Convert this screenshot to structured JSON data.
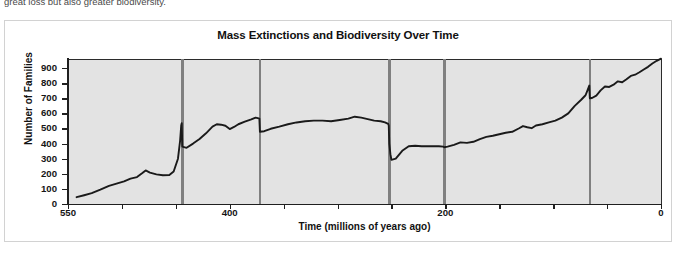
{
  "page_text_fragment": "great loss but also greater biodiversity.",
  "figure": {
    "title": "Mass Extinctions and Biodiversity Over Time"
  },
  "chart_data": {
    "type": "line",
    "title": "Mass Extinctions and Biodiversity Over Time",
    "xlabel": "Time (millions of years ago)",
    "ylabel": "Number of Families",
    "xlim": [
      550,
      0
    ],
    "ylim": [
      0,
      960
    ],
    "x_reversed": true,
    "grid": false,
    "legend": null,
    "y_ticks": [
      0,
      100,
      200,
      300,
      400,
      500,
      600,
      700,
      800,
      900
    ],
    "y_tick_labels": [
      "0",
      "100",
      "200",
      "300",
      "400",
      "500",
      "600",
      "700",
      "800",
      "900"
    ],
    "x_ticks": [
      550,
      500,
      450,
      400,
      350,
      300,
      250,
      200,
      150,
      100,
      50,
      0
    ],
    "x_tick_labels_shown": [
      "550",
      "400",
      "200",
      "0"
    ],
    "x_labeled_ticks": [
      550,
      400,
      200,
      0
    ],
    "plot_background": "#e3e3e3",
    "line_color": "#1a1a1a",
    "extinction_line_color": "#808080",
    "extinction_events": [
      {
        "name": "end-Ordovician",
        "x": 444
      },
      {
        "name": "late-Devonian",
        "x": 372
      },
      {
        "name": "end-Permian",
        "x": 252
      },
      {
        "name": "end-Triassic",
        "x": 201
      },
      {
        "name": "end-Cretaceous",
        "x": 66
      }
    ],
    "series": [
      {
        "name": "Number of Families",
        "points": [
          [
            542,
            45
          ],
          [
            535,
            58
          ],
          [
            528,
            72
          ],
          [
            520,
            95
          ],
          [
            512,
            120
          ],
          [
            505,
            135
          ],
          [
            498,
            150
          ],
          [
            492,
            168
          ],
          [
            486,
            178
          ],
          [
            481,
            205
          ],
          [
            478,
            222
          ],
          [
            474,
            208
          ],
          [
            468,
            196
          ],
          [
            462,
            190
          ],
          [
            456,
            192
          ],
          [
            452,
            215
          ],
          [
            448,
            300
          ],
          [
            446,
            420
          ],
          [
            445,
            520
          ],
          [
            444.5,
            535
          ],
          [
            444,
            380
          ],
          [
            440,
            372
          ],
          [
            434,
            400
          ],
          [
            428,
            430
          ],
          [
            422,
            468
          ],
          [
            416,
            512
          ],
          [
            412,
            528
          ],
          [
            408,
            525
          ],
          [
            404,
            518
          ],
          [
            400,
            496
          ],
          [
            396,
            510
          ],
          [
            392,
            528
          ],
          [
            386,
            545
          ],
          [
            380,
            560
          ],
          [
            376,
            572
          ],
          [
            374,
            568
          ],
          [
            372.5,
            565
          ],
          [
            372,
            478
          ],
          [
            368,
            482
          ],
          [
            362,
            498
          ],
          [
            354,
            512
          ],
          [
            346,
            528
          ],
          [
            338,
            540
          ],
          [
            330,
            548
          ],
          [
            322,
            552
          ],
          [
            314,
            552
          ],
          [
            306,
            548
          ],
          [
            298,
            556
          ],
          [
            290,
            565
          ],
          [
            284,
            578
          ],
          [
            278,
            572
          ],
          [
            272,
            562
          ],
          [
            266,
            552
          ],
          [
            260,
            548
          ],
          [
            256,
            540
          ],
          [
            253,
            530
          ],
          [
            252.5,
            520
          ],
          [
            252,
            400
          ],
          [
            251,
            330
          ],
          [
            250,
            292
          ],
          [
            246,
            300
          ],
          [
            240,
            352
          ],
          [
            234,
            382
          ],
          [
            228,
            386
          ],
          [
            222,
            382
          ],
          [
            214,
            382
          ],
          [
            206,
            382
          ],
          [
            202,
            380
          ],
          [
            201,
            376
          ],
          [
            198,
            380
          ],
          [
            192,
            392
          ],
          [
            186,
            408
          ],
          [
            180,
            405
          ],
          [
            174,
            412
          ],
          [
            168,
            430
          ],
          [
            162,
            444
          ],
          [
            156,
            452
          ],
          [
            150,
            462
          ],
          [
            144,
            472
          ],
          [
            138,
            478
          ],
          [
            132,
            500
          ],
          [
            128,
            516
          ],
          [
            124,
            508
          ],
          [
            120,
            502
          ],
          [
            116,
            520
          ],
          [
            110,
            528
          ],
          [
            104,
            540
          ],
          [
            98,
            552
          ],
          [
            92,
            572
          ],
          [
            86,
            600
          ],
          [
            80,
            650
          ],
          [
            74,
            690
          ],
          [
            70,
            720
          ],
          [
            68,
            756
          ],
          [
            66.5,
            784
          ],
          [
            66,
            700
          ],
          [
            64,
            702
          ],
          [
            60,
            718
          ],
          [
            56,
            752
          ],
          [
            52,
            778
          ],
          [
            48,
            775
          ],
          [
            44,
            790
          ],
          [
            40,
            812
          ],
          [
            36,
            806
          ],
          [
            32,
            826
          ],
          [
            28,
            848
          ],
          [
            24,
            856
          ],
          [
            20,
            872
          ],
          [
            16,
            890
          ],
          [
            12,
            908
          ],
          [
            8,
            930
          ],
          [
            4,
            948
          ],
          [
            0,
            962
          ]
        ]
      }
    ]
  }
}
